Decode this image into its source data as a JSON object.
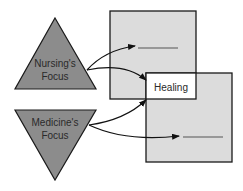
{
  "diagram": {
    "nursing": {
      "line1": "Nursing's",
      "line2": "Focus"
    },
    "medicine": {
      "line1": "Medicine's",
      "line2": "Focus"
    },
    "healing": {
      "label": "Healing"
    },
    "blank_top": {
      "label": "______"
    },
    "blank_bottom": {
      "label": "______"
    }
  },
  "colors": {
    "triangle_fill": "#8c8c8c",
    "box_fill": "#dcdcdc",
    "healing_fill": "#ffffff",
    "stroke": "#1a1a1a"
  }
}
